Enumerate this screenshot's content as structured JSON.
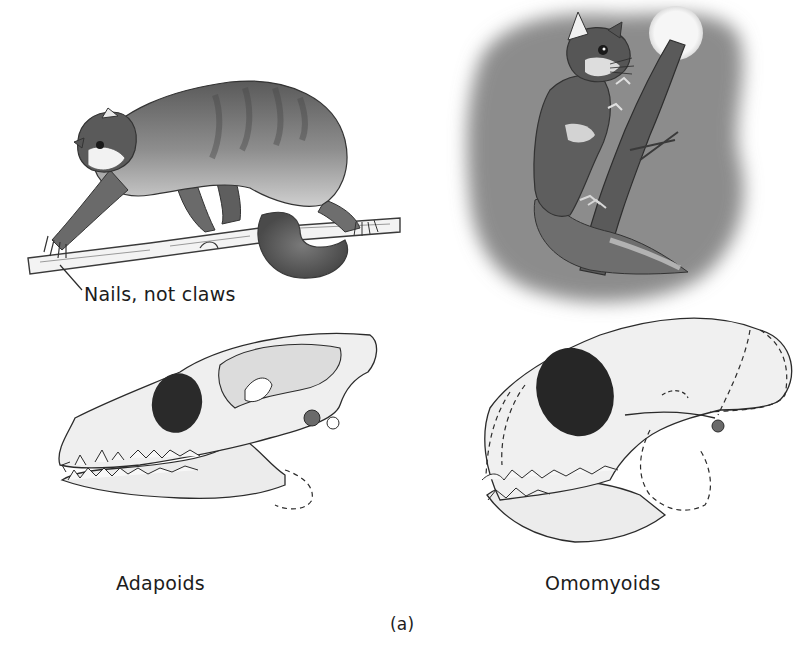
{
  "figure": {
    "panel_label": "(a)",
    "colors": {
      "background": "#ffffff",
      "night_sky": "#8a8a8a",
      "moon": "#f4f4f4",
      "fur_dark": "#4a4a4a",
      "fur_mid": "#8c8c8c",
      "bone": "#ededed",
      "orbit_dark": "#2a2a2a",
      "ink": "#2b2b2b"
    }
  },
  "panels": {
    "adapoid": {
      "animal": "adapoid-primate-on-branch",
      "callout": "Nails, not claws",
      "skull_label": "Adapoids"
    },
    "omomyoid": {
      "animal": "omomyoid-primate-on-tree-at-night",
      "skull_label": "Omomyoids"
    }
  }
}
